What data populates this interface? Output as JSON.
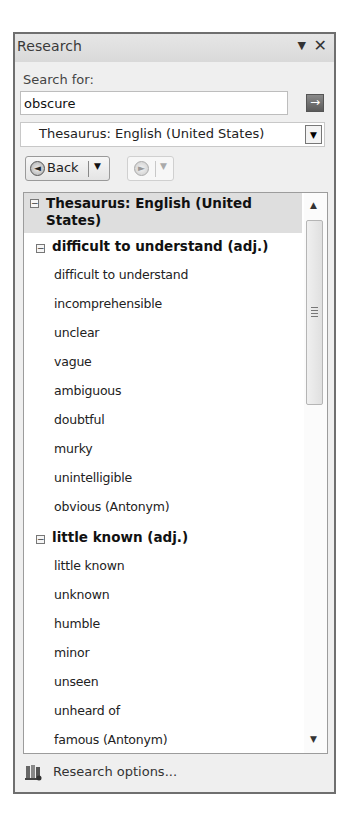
{
  "pane": {
    "title": "Research",
    "menu_icon": "▼",
    "close_icon": "✕"
  },
  "search": {
    "label": "Search for:",
    "value": "obscure",
    "go_icon": "→"
  },
  "source": {
    "selected": "Thesaurus: English (United States)",
    "arrow": "▼"
  },
  "nav": {
    "back_label": "Back",
    "back_icon": "◄",
    "forward_icon": "►",
    "dropdown_icon": "▼"
  },
  "results": {
    "section_title": "Thesaurus: English (United States)",
    "section_toggle": "−",
    "groups": [
      {
        "heading": "difficult to understand (adj.)",
        "toggle": "−",
        "items": [
          "difficult to understand",
          "incomprehensible",
          "unclear",
          "vague",
          "ambiguous",
          "doubtful",
          "murky",
          "unintelligible",
          "obvious (Antonym)"
        ]
      },
      {
        "heading": "little known (adj.)",
        "toggle": "−",
        "items": [
          "little known",
          "unknown",
          "humble",
          "minor",
          "unseen",
          "unheard of",
          "famous (Antonym)"
        ]
      }
    ],
    "scroll_up_icon": "▲",
    "scroll_down_icon": "▼"
  },
  "footer": {
    "options_label": "Research options..."
  }
}
